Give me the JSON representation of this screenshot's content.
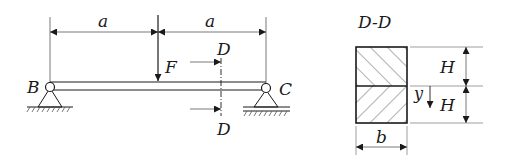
{
  "beam": {
    "left_support_label": "B",
    "right_support_label": "C",
    "span_left_label": "a",
    "span_right_label": "a",
    "force_label": "F",
    "section_top_label": "D",
    "section_bottom_label": "D"
  },
  "section": {
    "title": "D-D",
    "width_label": "b",
    "upper_height_label": "H",
    "lower_height_label": "H",
    "coordinate_label": "y"
  },
  "colors": {
    "stroke": "#1a1a1a",
    "thin": "#555555",
    "background": "#ffffff"
  }
}
